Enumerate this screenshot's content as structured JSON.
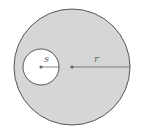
{
  "diagram": {
    "outer_circle": {
      "cx": 72,
      "cy": 67,
      "r": 58,
      "fill": "#d6d6d6",
      "stroke": "#555555",
      "radius_label": "r"
    },
    "inner_circle": {
      "cx": 41,
      "cy": 67,
      "r": 18,
      "fill": "#ffffff",
      "stroke": "#555555",
      "radius_label": "s"
    }
  }
}
